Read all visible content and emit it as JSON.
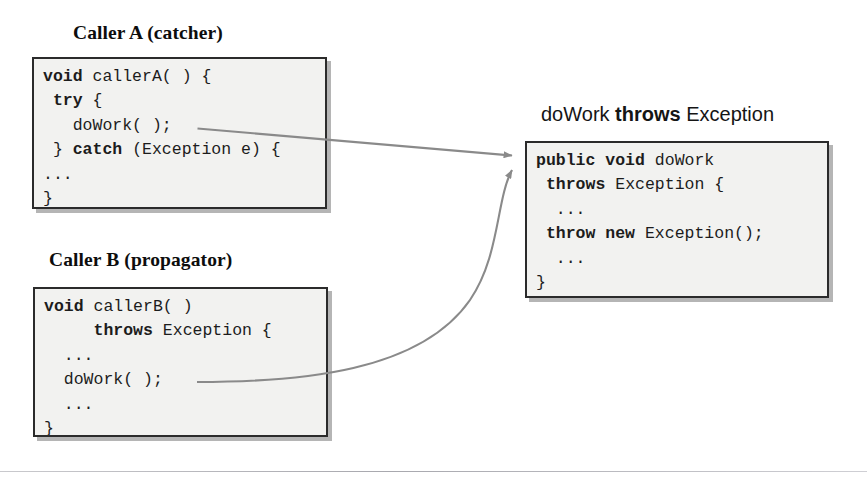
{
  "figure": {
    "line_color": "#8a8a8a",
    "box_fill": "#f2f2f0",
    "box_border": "#2b2b2b",
    "text_color": "#1c1c1c"
  },
  "caller_a": {
    "heading": "Caller A (catcher)",
    "code_lines": [
      [
        {
          "t": "void",
          "w": "bold"
        },
        {
          "t": " callerA( ) {",
          "w": "normal"
        }
      ],
      [
        {
          "t": " ",
          "w": "normal"
        },
        {
          "t": "try",
          "w": "bold"
        },
        {
          "t": " {",
          "w": "normal"
        }
      ],
      [
        {
          "t": "   doWork( );",
          "w": "normal"
        }
      ],
      [
        {
          "t": " } ",
          "w": "normal"
        },
        {
          "t": "catch",
          "w": "bold"
        },
        {
          "t": " (Exception e) {",
          "w": "normal"
        }
      ],
      [
        {
          "t": "...",
          "w": "normal"
        }
      ],
      [
        {
          "t": "}",
          "w": "normal"
        }
      ]
    ]
  },
  "caller_b": {
    "heading": "Caller B (propagator)",
    "code_lines": [
      [
        {
          "t": "void",
          "w": "bold"
        },
        {
          "t": " callerB( )",
          "w": "normal"
        }
      ],
      [
        {
          "t": "     ",
          "w": "normal"
        },
        {
          "t": "throws",
          "w": "bold"
        },
        {
          "t": " Exception {",
          "w": "normal"
        }
      ],
      [
        {
          "t": "  ...",
          "w": "normal"
        }
      ],
      [
        {
          "t": "  doWork( );",
          "w": "normal"
        }
      ],
      [
        {
          "t": "  ...",
          "w": "normal"
        }
      ],
      [
        {
          "t": "}",
          "w": "normal"
        }
      ]
    ]
  },
  "dowork": {
    "heading_parts": [
      {
        "t": "doWork",
        "w": "normal"
      },
      {
        "t": " throws",
        "w": "bold"
      },
      {
        "t": " Exception",
        "w": "normal"
      }
    ],
    "heading_text": "doWork throws Exception",
    "code_lines": [
      [
        {
          "t": "public void",
          "w": "bold"
        },
        {
          "t": " doWork",
          "w": "normal"
        }
      ],
      [
        {
          "t": " ",
          "w": "normal"
        },
        {
          "t": "throws",
          "w": "bold"
        },
        {
          "t": " Exception {",
          "w": "normal"
        }
      ],
      [
        {
          "t": "  ...",
          "w": "normal"
        }
      ],
      [
        {
          "t": " ",
          "w": "normal"
        },
        {
          "t": "throw new",
          "w": "bold"
        },
        {
          "t": " Exception();",
          "w": "normal"
        }
      ],
      [
        {
          "t": "  ...",
          "w": "normal"
        }
      ],
      [
        {
          "t": "}",
          "w": "normal"
        }
      ]
    ]
  },
  "arrows": [
    {
      "name": "caller-a-to-dowork",
      "from": "doWork( ); in Caller A",
      "to": "doWork method box",
      "shape": "straight"
    },
    {
      "name": "caller-b-to-dowork",
      "from": "doWork( ); in Caller B",
      "to": "doWork method box",
      "shape": "curved"
    }
  ]
}
